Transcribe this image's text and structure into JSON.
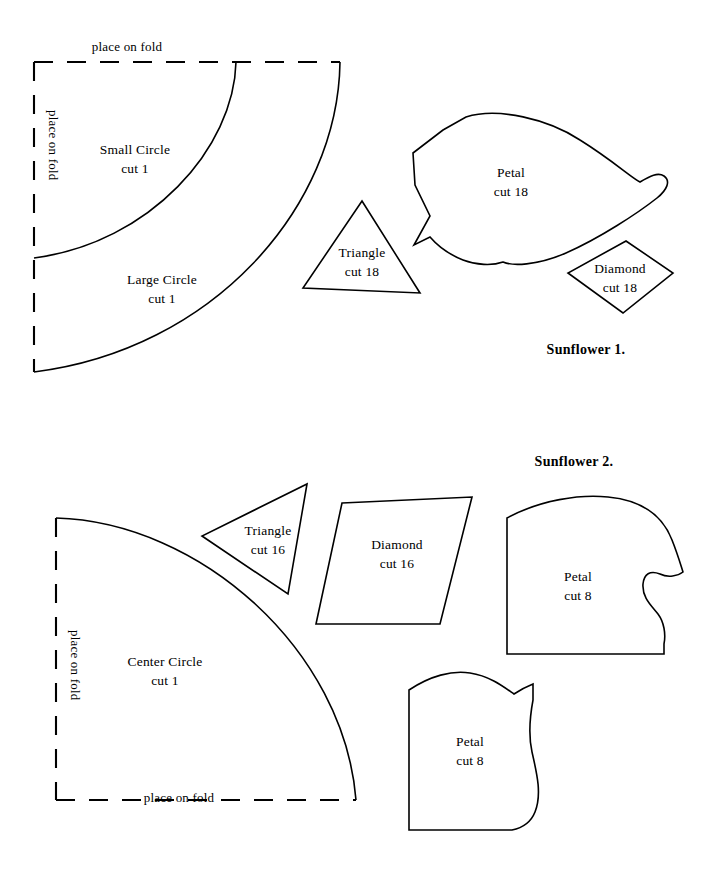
{
  "document": {
    "title": "Sunflower Quilt Pattern Templates",
    "background_color": "#ffffff",
    "ink_color": "#000000"
  },
  "sections": [
    {
      "id": "sunflower-1",
      "title": "Sunflower 1.",
      "fold_labels": {
        "top": "place on fold",
        "left": "place on fold"
      },
      "pieces": [
        {
          "id": "small-circle",
          "name": "Small Circle",
          "cut": "cut 1"
        },
        {
          "id": "large-circle",
          "name": "Large Circle",
          "cut": "cut 1"
        },
        {
          "id": "triangle",
          "name": "Triangle",
          "cut": "cut 18"
        },
        {
          "id": "petal",
          "name": "Petal",
          "cut": "cut 18"
        },
        {
          "id": "diamond",
          "name": "Diamond",
          "cut": "cut 18"
        }
      ]
    },
    {
      "id": "sunflower-2",
      "title": "Sunflower 2.",
      "fold_labels": {
        "left": "place on fold",
        "bottom": "place on fold"
      },
      "pieces": [
        {
          "id": "center-circle",
          "name": "Center Circle",
          "cut": "cut 1"
        },
        {
          "id": "triangle",
          "name": "Triangle",
          "cut": "cut 16"
        },
        {
          "id": "diamond",
          "name": "Diamond",
          "cut": "cut 16"
        },
        {
          "id": "petal-upper",
          "name": "Petal",
          "cut": "cut 8"
        },
        {
          "id": "petal-lower",
          "name": "Petal",
          "cut": "cut 8"
        }
      ]
    }
  ]
}
